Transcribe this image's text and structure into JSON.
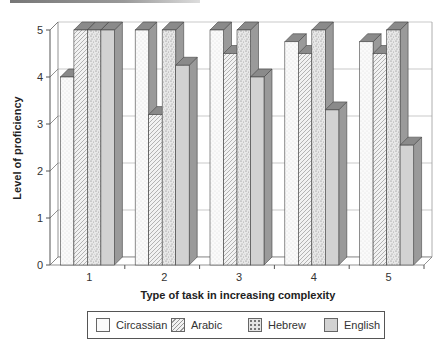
{
  "chart_data": {
    "type": "bar",
    "style": "3d-clustered",
    "title": "",
    "xlabel": "Type of task in increasing complexity",
    "ylabel": "Level of proficiency",
    "ylim": [
      0,
      5
    ],
    "yticks": [
      "0",
      "1",
      "2",
      "3",
      "4",
      "5"
    ],
    "categories": [
      "1",
      "2",
      "3",
      "4",
      "5"
    ],
    "grid": true,
    "legend_position": "bottom",
    "series": [
      {
        "name": "Circassian",
        "values": [
          4.0,
          5.0,
          5.0,
          4.75,
          4.75
        ],
        "pattern": "fine-dots",
        "fill": "#f7f7f7"
      },
      {
        "name": "Arabic",
        "values": [
          5.0,
          3.2,
          4.5,
          4.5,
          4.5
        ],
        "pattern": "diagonal-hatch",
        "fill": "#eeeeee"
      },
      {
        "name": "Hebrew",
        "values": [
          5.0,
          5.0,
          5.0,
          5.0,
          5.0
        ],
        "pattern": "coarse-dots",
        "fill": "#e0e0e0"
      },
      {
        "name": "English",
        "values": [
          5.0,
          4.25,
          4.0,
          3.3,
          2.55
        ],
        "pattern": "solid",
        "fill": "#cfcfcf"
      }
    ]
  },
  "legend": {
    "items": [
      {
        "label": "Circassian"
      },
      {
        "label": "Arabic"
      },
      {
        "label": "Hebrew"
      },
      {
        "label": "English"
      }
    ]
  },
  "colors": {
    "bar_top": "#8a8a8a",
    "bar_side": "#9a9a9a",
    "outline": "#444444",
    "grid": "#bbbbbb"
  }
}
